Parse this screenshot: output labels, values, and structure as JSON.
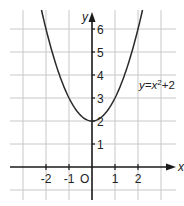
{
  "chart_data": {
    "type": "line",
    "title": "",
    "xlabel": "x",
    "ylabel": "y",
    "origin_label": "O",
    "xlim": [
      -3.4,
      3.6
    ],
    "ylim": [
      -1.4,
      6.8
    ],
    "x_ticks": [
      -2,
      -1,
      1,
      2
    ],
    "x_tick_labels": [
      "-2",
      "-1",
      "1",
      "2"
    ],
    "y_ticks": [
      1,
      2,
      3,
      4,
      5,
      6
    ],
    "y_tick_labels": [
      "1",
      "2",
      "3",
      "4",
      "5",
      "6"
    ],
    "grid": true,
    "series": [
      {
        "name": "y=x²+2",
        "function": "x^2+2",
        "x": [
          -2.1,
          -2,
          -1.5,
          -1,
          -0.5,
          0,
          0.5,
          1,
          1.5,
          2,
          2.1
        ],
        "y": [
          6.41,
          6,
          4.25,
          3,
          2.25,
          2,
          2.25,
          3,
          4.25,
          6,
          6.41
        ]
      }
    ],
    "annotations": [
      {
        "text_prefix": "y=x",
        "superscript": "2",
        "text_suffix": "+2",
        "x": 2.1,
        "y": 3.8
      }
    ]
  },
  "colors": {
    "grid": "#c8c8c8",
    "axis": "#1a1a1a",
    "curve": "#2a2a2a",
    "background": "#ffffff"
  }
}
